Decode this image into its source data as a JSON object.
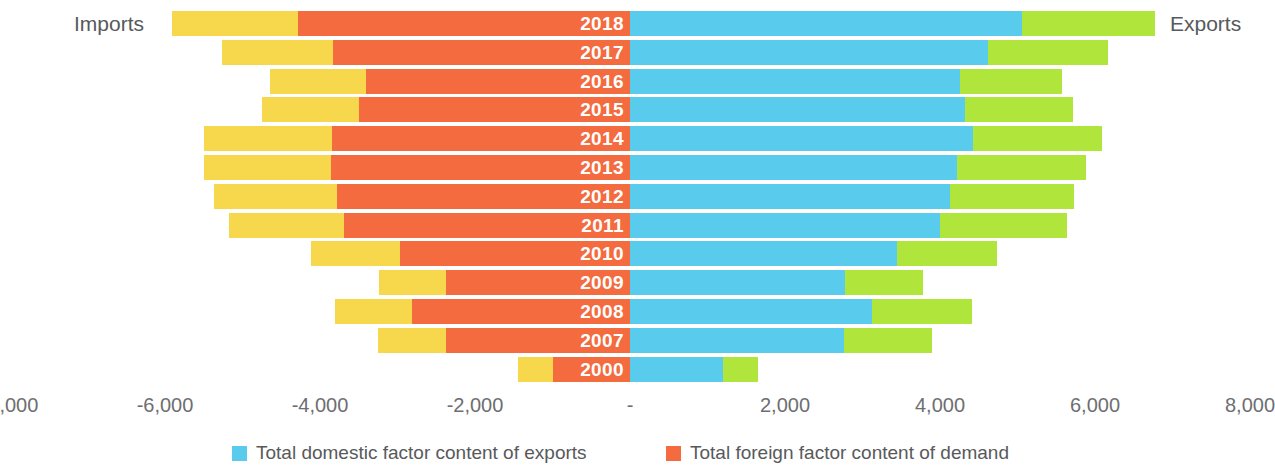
{
  "chart_data": {
    "type": "bar",
    "subtype": "diverging-stacked-horizontal",
    "title": "",
    "xlabel": "",
    "ylabel": "",
    "left_caption": "Imports",
    "right_caption": "Exports",
    "xlim": [
      -8000,
      8000
    ],
    "grid": false,
    "legend_position": "bottom",
    "zero_tick_label": "-",
    "categories": [
      "2018",
      "2017",
      "2016",
      "2015",
      "2014",
      "2013",
      "2012",
      "2011",
      "2010",
      "2009",
      "2008",
      "2007",
      "2000"
    ],
    "tick_labels": [
      "-8,000",
      "-6,000",
      "-4,000",
      "-2,000",
      "-",
      "2,000",
      "4,000",
      "6,000",
      "8,000"
    ],
    "tick_values": [
      -8000,
      -6000,
      -4000,
      -2000,
      0,
      2000,
      4000,
      6000,
      8000
    ],
    "series": [
      {
        "name": "Total domestic factor content of imports",
        "color": "#F7D74C",
        "side": "left",
        "values": [
          1630,
          1430,
          1230,
          1250,
          1660,
          1640,
          1590,
          1490,
          1140,
          870,
          1000,
          880,
          460
        ]
      },
      {
        "name": "Total foreign factor content of demand",
        "color": "#F36B3F",
        "side": "left",
        "values": [
          4280,
          3830,
          3410,
          3500,
          3840,
          3860,
          3780,
          3690,
          2970,
          2370,
          2810,
          2370,
          990
        ]
      },
      {
        "name": "Total domestic factor content of exports",
        "color": "#59CCEE",
        "side": "right",
        "values": [
          5060,
          4620,
          4260,
          4320,
          4430,
          4220,
          4130,
          4000,
          3450,
          2770,
          3120,
          2760,
          1200
        ]
      },
      {
        "name": "Total foreign factor content of exports",
        "color": "#B0E63C",
        "side": "right",
        "values": [
          1720,
          1550,
          1320,
          1390,
          1660,
          1660,
          1600,
          1640,
          1280,
          1010,
          1290,
          1140,
          450
        ]
      }
    ],
    "legend": [
      {
        "label": "Total domestic factor content of exports",
        "color": "#59CCEE"
      },
      {
        "label": "Total foreign factor content of demand",
        "color": "#F36B3F"
      }
    ]
  },
  "colors": {
    "yellow": "#F7D74C",
    "orange": "#F36B3F",
    "blue": "#59CCEE",
    "green": "#B0E63C",
    "text": "#58595b",
    "tick_text": "#6d6e71",
    "background": "#ffffff",
    "year_text": "#ffffff"
  },
  "layout": {
    "zero_x": 630,
    "px_per_unit": 0.0775,
    "row_top": 11,
    "row_pitch": 28.8,
    "bar_height": 25,
    "tick_y": 392,
    "legend_y": 440,
    "legend_x_1": 232,
    "legend_x_2": 666
  }
}
